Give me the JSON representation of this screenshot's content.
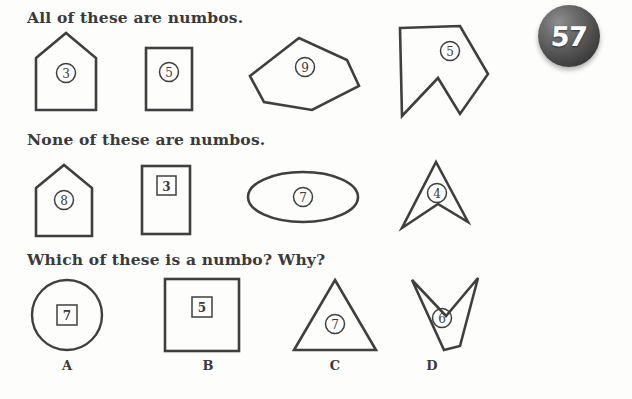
{
  "worksheet": {
    "page_number": "57",
    "headings": {
      "positive": "All of these are numbos.",
      "negative": "None of these are numbos.",
      "question": "Which of these is a numbo? Why?"
    }
  },
  "rows": {
    "positive_examples": {
      "label": "All of these are numbos.",
      "items": [
        {
          "name": "pentagon-house",
          "number": "3",
          "enclosure": "circle"
        },
        {
          "name": "rectangle-portrait",
          "number": "5",
          "enclosure": "circle"
        },
        {
          "name": "hexagon",
          "number": "9",
          "enclosure": "circle"
        },
        {
          "name": "concave-arrow-flag",
          "number": "5",
          "enclosure": "circle"
        }
      ]
    },
    "negative_examples": {
      "label": "None of these are numbos.",
      "items": [
        {
          "name": "pentagon-house",
          "number": "8",
          "enclosure": "circle"
        },
        {
          "name": "rectangle-portrait",
          "number": "3",
          "enclosure": "square"
        },
        {
          "name": "ellipse",
          "number": "7",
          "enclosure": "circle"
        },
        {
          "name": "concave-arrowhead",
          "number": "4",
          "enclosure": "circle"
        }
      ]
    },
    "answer_choices": {
      "label": "Which of these is a numbo? Why?",
      "items": [
        {
          "name": "circle",
          "letter": "A",
          "number": "7",
          "enclosure": "square"
        },
        {
          "name": "square",
          "letter": "B",
          "number": "5",
          "enclosure": "square"
        },
        {
          "name": "triangle",
          "letter": "C",
          "number": "7",
          "enclosure": "circle"
        },
        {
          "name": "concave-chevron-down",
          "letter": "D",
          "number": "6",
          "enclosure": "circle"
        }
      ]
    }
  },
  "colors": {
    "ink": "#3a3a3a",
    "stroke": "#3f3f3f",
    "paper": "#fdfdfc",
    "badge_fill": "#4a4a4a",
    "badge_text": "#ffffff"
  }
}
